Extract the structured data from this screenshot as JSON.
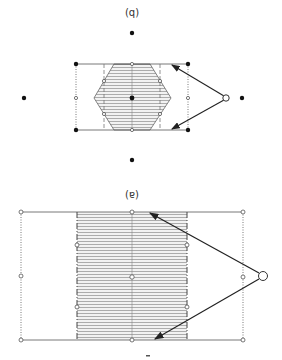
{
  "figure": {
    "orientation": "rotated-180",
    "panel_b": {
      "label": "(q)",
      "label_meaning": "(b)",
      "shape": "hexagon",
      "description": "Hexagonal hatched region inside rectangle with filled lattice points and arrows from an open circle"
    },
    "panel_a": {
      "label": "(ɐ)",
      "label_meaning": "(a)",
      "shape": "rectangle",
      "description": "Rectangular hatched strip inside larger rectangle with open circle points and arrows from a large open circle"
    },
    "colors": {
      "line": "#555555",
      "hatch": "#9a9a9a",
      "fill_hex": "#e6e6e6",
      "arrow": "#222222",
      "dot": "#111111"
    }
  }
}
